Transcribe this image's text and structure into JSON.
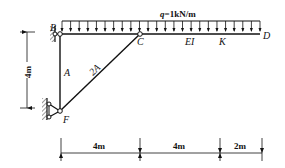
{
  "diagram": {
    "type": "structural-frame",
    "load": {
      "label": "q=1kN/m",
      "q_symbol": "q",
      "q_value": "=1kN/m",
      "type": "uniformly-distributed",
      "span": "B to D"
    },
    "nodes": {
      "B": "B",
      "C": "C",
      "D": "D",
      "F": "F",
      "K": "K"
    },
    "members": {
      "column_label": "A",
      "strut_label": "2A",
      "beam_label": "EI"
    },
    "dimensions": {
      "vertical": "4m",
      "horizontal": [
        "4m",
        "4m",
        "2m"
      ]
    },
    "colors": {
      "line": "#111111",
      "hatch": "#555555",
      "background": "#ffffff"
    }
  }
}
